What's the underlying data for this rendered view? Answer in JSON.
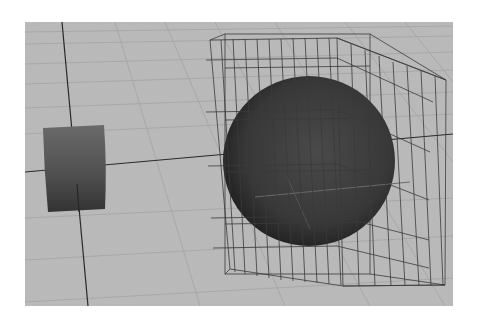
{
  "app": {
    "title": "3D Viewport"
  },
  "viewport": {
    "label": "Perspective viewport",
    "background_color": "#b9b9b9",
    "grid_color": "#a9a9a9",
    "axis_color": "#2a2a2a"
  },
  "scene": {
    "objects": [
      {
        "name": "Cylinder",
        "type": "cylinder",
        "shading": "smooth",
        "color": "#555555"
      },
      {
        "name": "Sphere",
        "type": "sphere",
        "shading": "smooth",
        "color": "#3a3a3a"
      },
      {
        "name": "Lattice",
        "type": "lattice-cage",
        "shading": "wireframe",
        "color": "#333333"
      }
    ]
  }
}
